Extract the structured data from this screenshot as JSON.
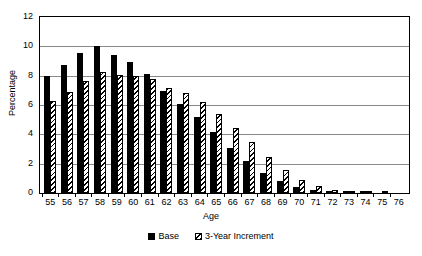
{
  "chart_data": {
    "type": "bar",
    "title": "",
    "xlabel": "Age",
    "ylabel": "Percentage",
    "ylim": [
      0,
      12
    ],
    "ytick_step": 2,
    "yticks": [
      0,
      2,
      4,
      6,
      8,
      10,
      12
    ],
    "grid": true,
    "legend_position": "bottom-center",
    "categories": [
      "55",
      "56",
      "57",
      "58",
      "59",
      "60",
      "61",
      "62",
      "63",
      "64",
      "65",
      "66",
      "67",
      "68",
      "69",
      "70",
      "71",
      "72",
      "73",
      "74",
      "75",
      "76"
    ],
    "series": [
      {
        "name": "Base",
        "style": "solid-black",
        "color": "#000000",
        "values": [
          8.0,
          8.75,
          9.55,
          10.05,
          9.4,
          8.9,
          8.1,
          6.95,
          6.1,
          5.2,
          4.15,
          3.05,
          2.15,
          1.35,
          0.85,
          0.4,
          0.2,
          0.1,
          0.05,
          0.03,
          0.0,
          0.0
        ]
      },
      {
        "name": "3-Year Increment",
        "style": "diagonal-hatch",
        "color": "#000000",
        "values": [
          6.3,
          6.9,
          7.65,
          8.25,
          8.05,
          8.0,
          7.75,
          7.15,
          6.8,
          6.2,
          5.4,
          4.45,
          3.45,
          2.45,
          1.6,
          0.9,
          0.45,
          0.2,
          0.1,
          0.05,
          0.02,
          0.0
        ]
      }
    ]
  }
}
